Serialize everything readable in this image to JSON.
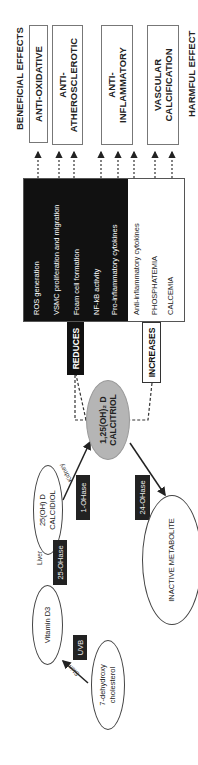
{
  "diagram": {
    "side_labels": {
      "beneficial": "BENEFICIAL EFFECTS",
      "harmful": "HARMFUL EFFECT"
    },
    "effects": [
      {
        "label": "ANTI-OXIDATIVE"
      },
      {
        "label": "ANTI-\nATHEROSCLEROTIC"
      },
      {
        "label": "ANTI-\nINFLAMMATORY"
      },
      {
        "label": "VASCULAR\nCALCIFICATION"
      }
    ],
    "reduces": {
      "label": "REDUCES",
      "items": [
        "ROS generation",
        "VSMC proliferation and migration",
        "Foam cell formation",
        "NF-kB activity",
        "Pro-inflammatory cytokines"
      ]
    },
    "increases": {
      "label": "INCREASES",
      "items": [
        "Anti-inflammatory cytokines",
        "PHOSPHATEMIA",
        "CALCEMIA"
      ]
    },
    "nodes": {
      "calcitriol_line1": "1,25(OH)₂ D",
      "calcitriol_line2": "CALCITRIOL",
      "calcidiol_line1": "25(OH) D",
      "calcidiol_line2": "CALCIDIOL",
      "vitamin_d3": "Vitamin D3",
      "dehydro_line1": "7-dehydroxy",
      "dehydro_line2": "cholesterol",
      "inactive": "INACTIVE METABOLITE"
    },
    "enzymes": {
      "one_ohase": "1-OHase",
      "twentyfour_ohase": "24-OHase",
      "twentyfive_ohase": "25-OHase",
      "uvb": "UVB"
    },
    "sites": {
      "kidney": "Kidney",
      "liver": "Liver",
      "skin": "Skin"
    },
    "colors": {
      "black": "#111111",
      "grey_node": "#b5b5b5",
      "border": "#777777"
    }
  }
}
